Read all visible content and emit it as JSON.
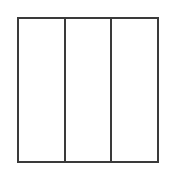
{
  "diagram": {
    "shape": "square",
    "columns": 3,
    "stroke_color": "#3a3a3a",
    "fill_color": "#ffffff",
    "panels": [
      {
        "label": ""
      },
      {
        "label": ""
      },
      {
        "label": ""
      }
    ]
  }
}
